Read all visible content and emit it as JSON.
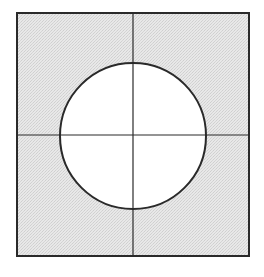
{
  "diagram": {
    "colors": {
      "background": "#ffffff",
      "square_fill": "#e4e4e4",
      "stroke": "#2a2a2a",
      "circle_fill": "#ffffff"
    },
    "square": {
      "x": 17,
      "y": 13,
      "width": 232,
      "height": 243
    },
    "circle": {
      "cx": 133,
      "cy": 136,
      "r": 73
    },
    "vertical_line_x": 133,
    "horizontal_line_y": 135
  }
}
